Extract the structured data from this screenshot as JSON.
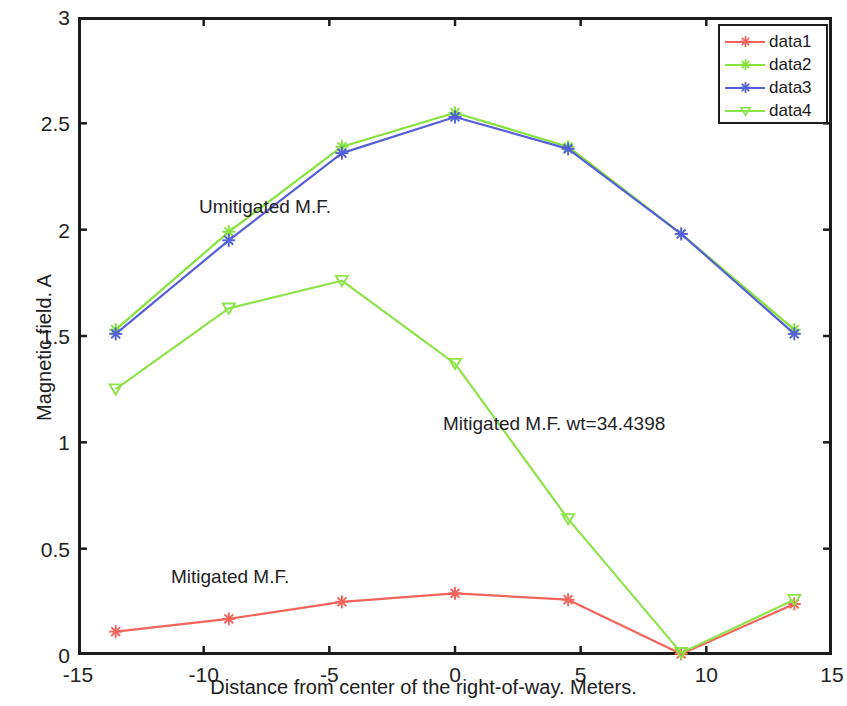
{
  "chart_data": {
    "type": "line",
    "title": "",
    "xlabel": "Distance from center of the right-of-way. Meters.",
    "ylabel": "Magnetic field. A",
    "xlim": [
      -15,
      15
    ],
    "ylim": [
      0,
      3
    ],
    "xticks": [
      "-15",
      "-10",
      "-5",
      "0",
      "5",
      "10",
      "15"
    ],
    "xtick_values": [
      -15,
      -10,
      -5,
      0,
      5,
      10,
      15
    ],
    "yticks": [
      "0",
      "0.5",
      "1",
      "1.5",
      "2",
      "2.5",
      "3"
    ],
    "ytick_values": [
      0,
      0.5,
      1,
      1.5,
      2,
      2.5,
      3
    ],
    "grid": false,
    "legend_position": "top-right",
    "x": [
      -13.5,
      -9,
      -4.5,
      0,
      4.5,
      9,
      13.5
    ],
    "series": [
      {
        "name": "data1",
        "color": "#f4645a",
        "marker": "star",
        "label": "Mitigated M.F. (red)",
        "values": [
          0.11,
          0.17,
          0.25,
          0.29,
          0.26,
          0.005,
          0.24
        ]
      },
      {
        "name": "data2",
        "color": "#86e23c",
        "marker": "star",
        "label": "Unmitigated M.F. (green)",
        "values": [
          1.53,
          1.99,
          2.39,
          2.55,
          2.39,
          1.98,
          1.53
        ]
      },
      {
        "name": "data3",
        "color": "#5560d8",
        "marker": "star",
        "label": "Unmitigated M.F. (blue)",
        "values": [
          1.51,
          1.95,
          2.36,
          2.53,
          2.38,
          1.98,
          1.51
        ]
      },
      {
        "name": "data4",
        "color": "#8de34a",
        "marker": "tri-down",
        "label": "Mitigated M.F. wt=34.4398 (green)",
        "values": [
          1.25,
          1.63,
          1.76,
          1.37,
          0.64,
          0.01,
          0.26
        ]
      }
    ],
    "annotations": [
      {
        "id": "unmitigated",
        "text": "Umitigated M.F.",
        "x": -5.8,
        "y": 2.09
      },
      {
        "id": "mitigated_wt",
        "text": "Mitigated M.F. wt=34.4398",
        "x": -0.5,
        "y": 1.06
      },
      {
        "id": "mitigated",
        "text": "Mitigated M.F.",
        "x": -11.3,
        "y": 0.35
      }
    ]
  },
  "axes": {
    "x_title": "Distance from center of the right-of-way. Meters.",
    "y_title": "Magnetic field. A",
    "x_ticks": [
      "-15",
      "-10",
      "-5",
      "0",
      "5",
      "10",
      "15"
    ],
    "y_ticks": [
      "0",
      "0.5",
      "1",
      "1.5",
      "2",
      "2.5",
      "3"
    ]
  },
  "annotations": {
    "unmitigated": "Umitigated M.F.",
    "mitigated_wt": "Mitigated M.F. wt=34.4398",
    "mitigated": "Mitigated M.F."
  },
  "legend": {
    "entries": [
      {
        "label": "data1",
        "color": "#f4645a"
      },
      {
        "label": "data2",
        "color": "#86e23c"
      },
      {
        "label": "data3",
        "color": "#5560d8"
      },
      {
        "label": "data4",
        "color": "#8de34a"
      }
    ]
  }
}
